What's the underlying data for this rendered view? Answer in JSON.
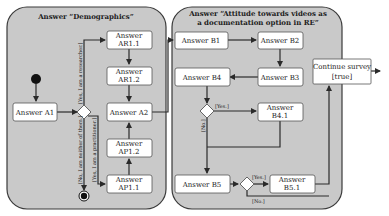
{
  "panels": {
    "demographics": {
      "title": "Answer “Demographics”"
    },
    "attitude": {
      "title_line1": "Answer “Attitude towards videos as",
      "title_line2": "a documentation option in RE”"
    }
  },
  "nodes": {
    "a1": "Answer A1",
    "ar11_l1": "Answer",
    "ar11_l2": "AR1.1",
    "ar12_l1": "Answer",
    "ar12_l2": "AR1.2",
    "a2": "Answer A2",
    "ap12_l1": "Answer",
    "ap12_l2": "AP1.2",
    "ap11_l1": "Answer",
    "ap11_l2": "AP1.1",
    "b1": "Answer B1",
    "b2": "Answer B2",
    "b3": "Answer B3",
    "b4": "Answer B4",
    "b41_l1": "Answer",
    "b41_l2": "B4.1",
    "b5": "Answer B5",
    "b51_l1": "Answer",
    "b51_l2": "B5.1",
    "continue_l1": "Continue survey",
    "continue_l2": "[true]"
  },
  "guards": {
    "researcher": "[Yes, I am a researcher.]",
    "practitioner": "[Yes, I am a practitioner.]",
    "neither": "[No, I am neither of them.]",
    "b4_yes": "[Yes.]",
    "b4_no": "[No.]",
    "b5_yes": "[Yes.]",
    "b5_no": "[No.]"
  }
}
